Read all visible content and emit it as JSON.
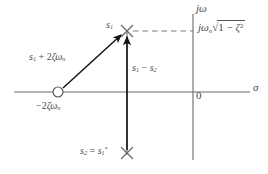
{
  "figure": {
    "name": "s-plane pole-zero diagram",
    "background_color": "#ffffff",
    "line_color": "#6b6b6b",
    "marker_color": "#555555",
    "arrow_color": "#1a1a1a",
    "text_color": "#4a4a4a",
    "width": 268,
    "height": 174
  },
  "axes": {
    "imaginary_axis_label": "jω",
    "real_axis_label": "σ",
    "origin_label": "0",
    "origin_px": {
      "x": 193,
      "y": 92
    },
    "real_axis_span_px": {
      "x1": 14,
      "x2": 250,
      "y": 92
    },
    "imaginary_axis_span_px": {
      "x": 193,
      "y1": 14,
      "y2": 160
    }
  },
  "labels": {
    "s1": {
      "text": "s",
      "sub": "1"
    },
    "s1_plus_2zeta_wn": {
      "lead": "s",
      "lead_sub": "1",
      "op": " + 2",
      "zeta": "ζ",
      "omega": "ω",
      "omega_sub": "n"
    },
    "neg_2zeta_wn": {
      "sign": "−2",
      "zeta": "ζ",
      "omega": "ω",
      "omega_sub": "n"
    },
    "s1_minus_s2": {
      "a": "s",
      "a_sub": "1",
      "op": " − ",
      "b": "s",
      "b_sub": "2"
    },
    "s2_eq_s1_conj": {
      "a": "s",
      "a_sub": "2",
      "op": " = ",
      "b": "s",
      "b_sub": "1",
      "b_sup": "*"
    },
    "jwn_sqrt": {
      "j": "j",
      "omega": "ω",
      "omega_sub": "n",
      "radical": "√",
      "radicand_left": "1 − ",
      "zeta": "ζ",
      "zeta_sup": "2"
    }
  },
  "markers": [
    {
      "name": "pole-s1",
      "type": "x-cross",
      "x": 127,
      "y": 31,
      "size": 11
    },
    {
      "name": "pole-s2",
      "type": "x-cross",
      "x": 127,
      "y": 153,
      "size": 11
    },
    {
      "name": "zero-minus-2zeta-wn",
      "type": "open-circle",
      "x": 58,
      "y": 92,
      "radius": 5
    }
  ],
  "vectors": [
    {
      "name": "vector-s1-plus-2zeta-wn",
      "from": {
        "x": 62,
        "y": 89
      },
      "to": {
        "x": 122,
        "y": 34
      }
    },
    {
      "name": "vector-s1-minus-s2",
      "from": {
        "x": 127,
        "y": 150
      },
      "to": {
        "x": 127,
        "y": 36
      }
    }
  ],
  "dashed_line": {
    "name": "imaginary-part-guide",
    "from": {
      "x": 133,
      "y": 31
    },
    "to": {
      "x": 193,
      "y": 31
    }
  }
}
